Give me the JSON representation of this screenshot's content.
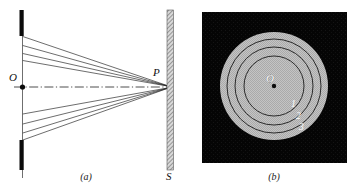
{
  "figure": {
    "type": "optics-diagram",
    "panels": [
      {
        "id": "a",
        "caption": "(a)",
        "kind": "ray-diagram",
        "labels": {
          "source_point": "O",
          "focus_point": "P",
          "screen": "S"
        },
        "elements": {
          "aperture_bar_top": "aperture-barrier-upper",
          "aperture_bar_bottom": "aperture-barrier-lower",
          "axis": "optical-axis",
          "rays_upper_count": 3,
          "rays_lower_count": 3,
          "screen_label": "S"
        }
      },
      {
        "id": "b",
        "caption": "(b)",
        "kind": "diffraction-pattern",
        "labels": {
          "center_point": "O",
          "ring_1": "1",
          "ring_2": "2",
          "ring_3": "3"
        },
        "rings": [
          {
            "label": "1",
            "radius": 30
          },
          {
            "label": "2",
            "radius": 39
          },
          {
            "label": "3",
            "radius": 47
          }
        ],
        "disc_radius": 54
      }
    ],
    "colors": {
      "background": "#ffffff",
      "ink": "#111111",
      "barrier": "#0b0b0b",
      "screen_hatch": "#8c8c8c",
      "pattern_field": "#060606",
      "pattern_disc": "#bdbdbd",
      "ring_stroke": "#1a1a1a",
      "white_text": "#ffffff"
    }
  }
}
